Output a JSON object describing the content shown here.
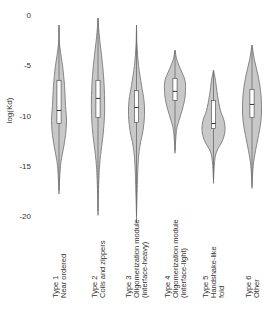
{
  "chart_data": {
    "type": "violin",
    "title": "",
    "xlabel": "",
    "ylabel": "log(Kd)",
    "ylim": [
      -20,
      0
    ],
    "yticks": [
      0,
      -5,
      -10,
      -15,
      -20
    ],
    "ytick_labels": [
      "0",
      "-5",
      "-10",
      "-15",
      "-20"
    ],
    "grid": false,
    "legend": null,
    "fill_color": "#c8c8c8",
    "stroke_color": "#7a7a7a",
    "box_color": "#ffffff",
    "categories": [
      [
        "Type 1",
        "Near ordered"
      ],
      [
        "Type 2",
        "Coils and zippers"
      ],
      [
        "Type 3",
        "Oligomerization module",
        "(interface-heavy)"
      ],
      [
        "Type 4",
        "Oligomerization module",
        "(interface-light)"
      ],
      [
        "Type 5",
        "Handshake-like",
        "fold"
      ],
      [
        "Type 6",
        "Other"
      ]
    ],
    "series": [
      {
        "name": "Type 1",
        "max": -1.0,
        "min": -17.5,
        "q3": -6.5,
        "median": -9.5,
        "q1": -10.8,
        "profile": [
          [
            -1.0,
            0
          ],
          [
            -3,
            0.6
          ],
          [
            -5,
            3.5
          ],
          [
            -7,
            5.5
          ],
          [
            -9,
            6.5
          ],
          [
            -10.5,
            7.5
          ],
          [
            -12,
            6.5
          ],
          [
            -13.5,
            4
          ],
          [
            -15,
            1.5
          ],
          [
            -17.5,
            0
          ]
        ]
      },
      {
        "name": "Type 2",
        "max": -0.3,
        "min": -19.5,
        "q3": -6.5,
        "median": -8.3,
        "q1": -10.2,
        "profile": [
          [
            -0.3,
            0
          ],
          [
            -2,
            1.2
          ],
          [
            -4,
            3.5
          ],
          [
            -6,
            5.5
          ],
          [
            -8,
            6.5
          ],
          [
            -10,
            6.5
          ],
          [
            -12,
            5
          ],
          [
            -14,
            2.5
          ],
          [
            -16,
            1
          ],
          [
            -19.5,
            0
          ]
        ]
      },
      {
        "name": "Type 3",
        "max": -1.0,
        "min": -20.0,
        "q3": -7.5,
        "median": -9.2,
        "q1": -10.7,
        "profile": [
          [
            -1.0,
            0
          ],
          [
            -3,
            0.5
          ],
          [
            -5,
            2
          ],
          [
            -7,
            5
          ],
          [
            -8.5,
            7.5
          ],
          [
            -10,
            8
          ],
          [
            -11.5,
            6.5
          ],
          [
            -13,
            3.5
          ],
          [
            -15,
            1.5
          ],
          [
            -20,
            0
          ]
        ]
      },
      {
        "name": "Type 4",
        "max": -3.5,
        "min": -13.5,
        "q3": -6.3,
        "median": -7.6,
        "q1": -8.5,
        "profile": [
          [
            -3.5,
            0
          ],
          [
            -4.5,
            2
          ],
          [
            -5.5,
            6
          ],
          [
            -6.5,
            10
          ],
          [
            -7.5,
            10.5
          ],
          [
            -8.5,
            9.5
          ],
          [
            -9.5,
            7
          ],
          [
            -10.5,
            4
          ],
          [
            -11.5,
            1.5
          ],
          [
            -13.5,
            0
          ]
        ]
      },
      {
        "name": "Type 5",
        "max": -5.5,
        "min": -16.5,
        "q3": -8.5,
        "median": -10.8,
        "q1": -11.3,
        "profile": [
          [
            -5.5,
            0
          ],
          [
            -6.5,
            2
          ],
          [
            -8,
            4
          ],
          [
            -9.5,
            7
          ],
          [
            -10.5,
            10.5
          ],
          [
            -11.5,
            11.5
          ],
          [
            -12.5,
            9
          ],
          [
            -13.5,
            3.5
          ],
          [
            -14.5,
            1.2
          ],
          [
            -16.5,
            0
          ]
        ]
      },
      {
        "name": "Type 6",
        "max": -3.0,
        "min": -17.0,
        "q3": -7.4,
        "median": -8.9,
        "q1": -10.2,
        "profile": [
          [
            -3.0,
            0
          ],
          [
            -4.5,
            2.5
          ],
          [
            -6,
            6
          ],
          [
            -7.5,
            8.5
          ],
          [
            -9,
            9.5
          ],
          [
            -10.5,
            9
          ],
          [
            -12,
            6.5
          ],
          [
            -13.5,
            3.5
          ],
          [
            -15,
            1.2
          ],
          [
            -17,
            0
          ]
        ]
      }
    ]
  }
}
